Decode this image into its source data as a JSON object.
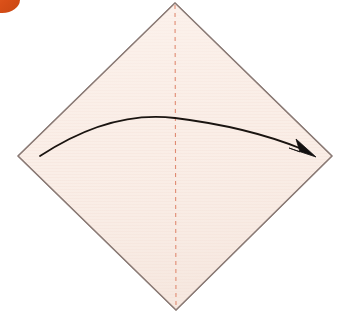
{
  "figure": {
    "kind": "origami-fold-diagram",
    "canvas": {
      "width": 350,
      "height": 320,
      "background": "#ffffff"
    }
  },
  "badge": {
    "name": "step-number-badge",
    "label": "",
    "color": "#e2561e",
    "visible": true
  },
  "paper": {
    "name": "square-paper-diamond",
    "fill": "#faeee7",
    "stroke": "#8a7a75",
    "stroke_width": 1.2,
    "points": "175,3 332,156 176,310 18,156",
    "vertices": {
      "top": [
        175,
        3
      ],
      "right": [
        332,
        156
      ],
      "bottom": [
        176,
        310
      ],
      "left": [
        18,
        156
      ]
    },
    "texture": "faint-horizontal-scan-lines"
  },
  "crease": {
    "name": "vertical-center-crease",
    "style": "dashed",
    "color": "#e08b72",
    "stroke_width": 1.1,
    "dash_pattern": "4 4",
    "from": [
      175,
      4
    ],
    "to": [
      176,
      309
    ]
  },
  "fold_arrow": {
    "name": "fold-direction-arrow",
    "color": "#1a1410",
    "stroke_width": 1.8,
    "path": "M 40,156 Q 110,110 175,118 Q 248,127 303,150",
    "start": [
      40,
      156
    ],
    "apex": [
      175,
      118
    ],
    "end": [
      316,
      156
    ],
    "head": {
      "shape": "solid-triangle",
      "points": "316,157 296,139 300,152 289,148",
      "color": "#131010"
    }
  },
  "colors": {
    "paper_fill": "#faeee7",
    "paper_edge": "#8a7a75",
    "crease_red": "#e08b72",
    "arrow_black": "#1a1410",
    "badge_orange": "#e2561e",
    "background_white": "#ffffff"
  }
}
